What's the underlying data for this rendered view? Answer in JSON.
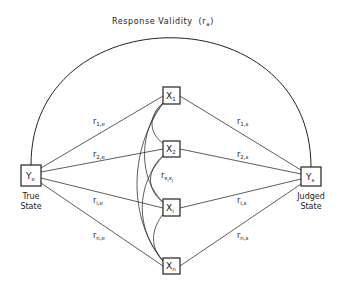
{
  "title": {
    "text": "Response  Validity",
    "symbol": "r",
    "symbol_sub": "a"
  },
  "nodes": {
    "true_state": {
      "symbol": "Y",
      "sub": "e",
      "caption_line1": "True",
      "caption_line2": "State"
    },
    "judged_state": {
      "symbol": "Y",
      "sub": "s",
      "caption_line1": "Judged",
      "caption_line2": "State"
    },
    "cues": [
      {
        "symbol": "X",
        "sub": "1"
      },
      {
        "symbol": "X",
        "sub": "2"
      },
      {
        "symbol": "X",
        "sub": "i"
      },
      {
        "symbol": "X",
        "sub": "n"
      }
    ]
  },
  "edges": {
    "ecological": [
      {
        "r": "r",
        "sub": "1,e"
      },
      {
        "r": "r",
        "sub": "2,e"
      },
      {
        "r": "r",
        "sub": "i,e"
      },
      {
        "r": "r",
        "sub": "n,e"
      }
    ],
    "utilization": [
      {
        "r": "r",
        "sub": "1,s"
      },
      {
        "r": "r",
        "sub": "2,s"
      },
      {
        "r": "r",
        "sub": "i,s"
      },
      {
        "r": "r",
        "sub": "n,s"
      }
    ],
    "intercue": {
      "r": "r",
      "sub": "x",
      "sub2": "i",
      "sub3": "x",
      "sub4": "j"
    }
  }
}
